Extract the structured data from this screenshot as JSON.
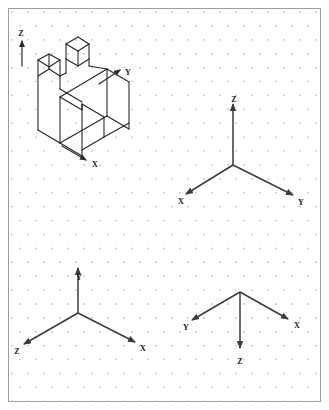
{
  "page": {
    "background_color": "#ffffff",
    "frame_color": "#9a9a9a",
    "grid": {
      "type": "isometric-dot-grid",
      "dot_color": "#b9b9c4",
      "col_spacing_px": 16,
      "row_spacing_px": 13.9,
      "stagger": "half-column offset on alternate rows"
    }
  },
  "figures": [
    {
      "id": "isometric-object",
      "quadrant": "top-left",
      "description": "Isometric pictorial of a machined block with two square prongs on top and a V-notch in the front face",
      "line_color": "#222222",
      "axes": [
        {
          "name": "Z",
          "label": "Z",
          "direction": "up",
          "label_x": 21,
          "label_y": 33
        },
        {
          "name": "Y",
          "label": "Y",
          "direction": "upper-right",
          "label_x": 128,
          "label_y": 74
        },
        {
          "name": "X",
          "label": "X",
          "direction": "lower-right",
          "label_x": 93,
          "label_y": 166
        }
      ]
    },
    {
      "id": "axis-triad-top-right",
      "quadrant": "top-right",
      "description": "Standard isometric axis triad, Z vertical up",
      "origin": {
        "x": 233,
        "y": 165
      },
      "axes": [
        {
          "name": "Z",
          "label": "Z",
          "direction": "up",
          "label_x": 234,
          "label_y": 100
        },
        {
          "name": "X",
          "label": "X",
          "direction": "lower-left",
          "label_x": 181,
          "label_y": 201
        },
        {
          "name": "Y",
          "label": "Y",
          "direction": "lower-right",
          "label_x": 301,
          "label_y": 202
        }
      ]
    },
    {
      "id": "axis-triad-bottom-left",
      "quadrant": "bottom-left",
      "description": "Isometric axis triad rotated: Y vertical up, Z lower-left, X lower-right",
      "origin": {
        "x": 78,
        "y": 313
      },
      "axes": [
        {
          "name": "Y",
          "label": "Y",
          "direction": "up",
          "label_x": 79,
          "label_y": 277
        },
        {
          "name": "Z",
          "label": "Z",
          "direction": "lower-left",
          "label_x": 17,
          "label_y": 351
        },
        {
          "name": "X",
          "label": "X",
          "direction": "lower-right",
          "label_x": 142,
          "label_y": 348
        }
      ]
    },
    {
      "id": "axis-triad-bottom-right",
      "quadrant": "bottom-right",
      "description": "Inverted isometric axis triad: Z vertical down, Y upper-left, X upper-right",
      "origin": {
        "x": 240,
        "y": 292
      },
      "axes": [
        {
          "name": "Y",
          "label": "Y",
          "direction": "upper-left",
          "label_x": 186,
          "label_y": 327
        },
        {
          "name": "X",
          "label": "X",
          "direction": "upper-right",
          "label_x": 296,
          "label_y": 325
        },
        {
          "name": "Z",
          "label": "Z",
          "direction": "down",
          "label_x": 240,
          "label_y": 361
        }
      ]
    }
  ]
}
